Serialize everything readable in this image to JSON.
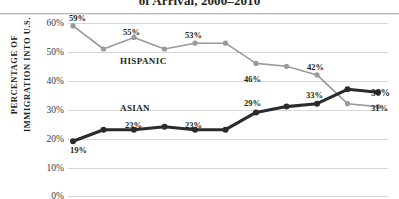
{
  "title": "of Arrival, 2000–2010",
  "axis_title_line1": "PERCENTAGE OF",
  "axis_title_line2": "IMMIGRATION INTO U.S.",
  "colors": {
    "hispanic": "#9a9a9a",
    "asian": "#2b2b2b",
    "gridline": "#d7d7d7",
    "rule": "#b9b9b9",
    "text": "#231f20"
  },
  "yticks": [
    "0%",
    "10%",
    "20%",
    "30%",
    "40%",
    "50%",
    "60%"
  ],
  "series_labels": {
    "hispanic": "HISPANIC",
    "asian": "ASIAN"
  },
  "point_labels": {
    "hispanic_first": "59%",
    "hispanic_2002": "55%",
    "hispanic_2004": "53%",
    "hispanic_2006": "46%",
    "hispanic_2008": "42%",
    "hispanic_last": "31%",
    "asian_first": "19%",
    "asian_2002": "23%",
    "asian_2004": "23%",
    "asian_2006": "29%",
    "asian_2008": "33%",
    "asian_last": "36%"
  },
  "chart_data": {
    "type": "line",
    "title": "of Arrival, 2000–2010",
    "xlabel": "",
    "ylabel": "PERCENTAGE OF IMMIGRATION INTO U.S.",
    "ylim": [
      0,
      60
    ],
    "yticks": [
      0,
      10,
      20,
      30,
      40,
      50,
      60
    ],
    "ytick_labels": [
      "0%",
      "10%",
      "20%",
      "30%",
      "40%",
      "50%",
      "60%"
    ],
    "grid": true,
    "legend": "inline-series-labels",
    "x": [
      2000,
      2001,
      2002,
      2003,
      2004,
      2005,
      2006,
      2007,
      2008,
      2009,
      2010
    ],
    "series": [
      {
        "name": "HISPANIC",
        "color": "#9a9a9a",
        "values": [
          59,
          51,
          55,
          51,
          53,
          53,
          46,
          45,
          42,
          32,
          31
        ],
        "labeled_points": {
          "2000": "59%",
          "2002": "55%",
          "2004": "53%",
          "2006": "46%",
          "2008": "42%",
          "2010": "31%"
        }
      },
      {
        "name": "ASIAN",
        "color": "#2b2b2b",
        "values": [
          19,
          23,
          23,
          24,
          23,
          23,
          29,
          31,
          32,
          37,
          36
        ],
        "labeled_points": {
          "2000": "19%",
          "2002": "23%",
          "2004": "23%",
          "2006": "29%",
          "2008": "33%",
          "2010": "36%"
        }
      }
    ]
  }
}
